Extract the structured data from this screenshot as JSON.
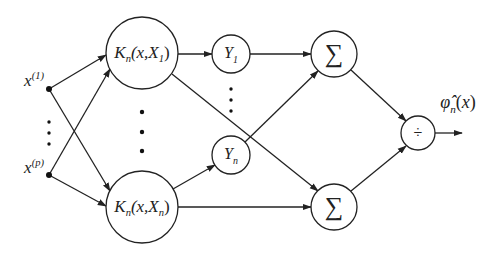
{
  "diagram": {
    "inputs": [
      {
        "id": "x1",
        "base": "x",
        "sup": "(1)",
        "x": 49,
        "y": 89
      },
      {
        "id": "xp",
        "base": "x",
        "sup": "(p)",
        "x": 49,
        "y": 175
      }
    ],
    "kernels": [
      {
        "id": "k1",
        "K": "K",
        "sub": "n",
        "args_open": "(x,X",
        "args_sub": "1",
        "args_close": ")",
        "cx": 142,
        "cy": 53,
        "r": 36
      },
      {
        "id": "kn",
        "K": "K",
        "sub": "n",
        "args_open": "(x,X",
        "args_sub": "n",
        "args_close": ")",
        "cx": 142,
        "cy": 207,
        "r": 36
      }
    ],
    "outputs_y": [
      {
        "id": "y1",
        "base": "Y",
        "sub": "1",
        "cx": 231,
        "cy": 54,
        "r": 19
      },
      {
        "id": "yn",
        "base": "Y",
        "sub": "n",
        "cx": 231,
        "cy": 155,
        "r": 19
      }
    ],
    "sums": [
      {
        "id": "sum_top",
        "symbol": "∑",
        "cx": 334,
        "cy": 54,
        "r": 23
      },
      {
        "id": "sum_bottom",
        "symbol": "∑",
        "cx": 334,
        "cy": 207,
        "r": 23
      }
    ],
    "divide": {
      "id": "divide",
      "symbol": "÷",
      "cx": 418,
      "cy": 133,
      "r": 17
    },
    "output": {
      "base": "φ̂",
      "sub": "n",
      "arg": "(x)",
      "x": 458,
      "y": 104
    },
    "ellipsis_dots": {
      "inputs": [
        [
          49,
          122
        ],
        [
          49,
          133
        ],
        [
          49,
          144
        ]
      ],
      "kernels": [
        [
          142,
          112
        ],
        [
          142,
          132
        ],
        [
          142,
          151
        ]
      ],
      "ys": [
        [
          231,
          89
        ],
        [
          231,
          100
        ],
        [
          231,
          111
        ]
      ]
    },
    "edges": [
      {
        "from": "x1",
        "to": "k1",
        "x1": 49,
        "y1": 89,
        "x2": 106,
        "y2": 55
      },
      {
        "from": "x1",
        "to": "kn",
        "x1": 49,
        "y1": 89,
        "x2": 110,
        "y2": 191
      },
      {
        "from": "xp",
        "to": "k1",
        "x1": 49,
        "y1": 175,
        "x2": 110,
        "y2": 69
      },
      {
        "from": "xp",
        "to": "kn",
        "x1": 49,
        "y1": 175,
        "x2": 106,
        "y2": 206
      },
      {
        "from": "k1",
        "to": "y1",
        "x1": 178,
        "y1": 54,
        "x2": 212,
        "y2": 54
      },
      {
        "from": "k1",
        "to": "sum_bottom",
        "x1": 172,
        "y1": 74,
        "x2": 318,
        "y2": 191
      },
      {
        "from": "kn",
        "to": "yn",
        "x1": 173,
        "y1": 189,
        "x2": 215,
        "y2": 165
      },
      {
        "from": "kn",
        "to": "sum_bottom",
        "x1": 178,
        "y1": 207,
        "x2": 311,
        "y2": 207
      },
      {
        "from": "y1",
        "to": "sum_top",
        "x1": 250,
        "y1": 54,
        "x2": 311,
        "y2": 54
      },
      {
        "from": "yn",
        "to": "sum_top",
        "x1": 245,
        "y1": 142,
        "x2": 318,
        "y2": 71
      },
      {
        "from": "sum_top",
        "to": "divide",
        "x1": 351,
        "y1": 70,
        "x2": 406,
        "y2": 121
      },
      {
        "from": "sum_bottom",
        "to": "divide",
        "x1": 351,
        "y1": 191,
        "x2": 406,
        "y2": 146
      },
      {
        "from": "divide",
        "to": "output",
        "x1": 435,
        "y1": 133,
        "x2": 462,
        "y2": 133
      }
    ],
    "colors": {
      "stroke": "#222222",
      "background": "#ffffff"
    }
  }
}
